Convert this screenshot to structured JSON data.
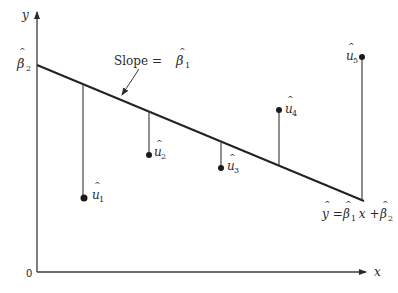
{
  "diagram": {
    "type": "regression-residuals",
    "axes": {
      "x_label": "x",
      "y_label": "y",
      "origin_label": "0"
    },
    "intercept_label": {
      "base": "β",
      "hat": "^",
      "sub": "2"
    },
    "slope_annotation": {
      "prefix": "Slope = ",
      "base": "β",
      "hat": "^",
      "sub": "1"
    },
    "equation": {
      "lhs": "y",
      "eq": " = ",
      "b1": "β",
      "b1_sub": "1",
      "x": " x + ",
      "b2": "β",
      "b2_sub": "2",
      "hat": "^"
    },
    "residuals": [
      {
        "label": "u",
        "sub": "1",
        "hat": "^",
        "x": 83,
        "line_y": 84,
        "point_y": 198
      },
      {
        "label": "u",
        "sub": "2",
        "hat": "^",
        "x": 149,
        "line_y": 111,
        "point_y": 155
      },
      {
        "label": "u",
        "sub": "3",
        "hat": "^",
        "x": 221,
        "line_y": 141,
        "point_y": 168
      },
      {
        "label": "u",
        "sub": "4",
        "hat": "^",
        "x": 279,
        "line_y": 165,
        "point_y": 110
      },
      {
        "label": "u",
        "sub": "5",
        "hat": "^",
        "x": 362,
        "line_y": 200,
        "point_y": 57
      }
    ],
    "colors": {
      "ink": "#2a2a2a",
      "background": "#ffffff"
    }
  }
}
